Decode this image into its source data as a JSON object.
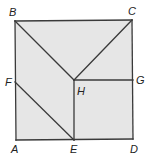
{
  "figure": {
    "type": "geometry-square-partition",
    "fill_color": "#e6e6e6",
    "stroke_color": "#3a3a3a",
    "points": {
      "A": {
        "label": "A",
        "x": 16,
        "y": 140
      },
      "B": {
        "label": "B",
        "x": 15,
        "y": 21
      },
      "C": {
        "label": "C",
        "x": 132,
        "y": 20
      },
      "D": {
        "label": "D",
        "x": 133,
        "y": 139
      },
      "E": {
        "label": "E",
        "x": 74,
        "y": 140
      },
      "F": {
        "label": "F",
        "x": 15,
        "y": 82
      },
      "G": {
        "label": "G",
        "x": 133,
        "y": 80
      },
      "H": {
        "label": "H",
        "x": 74,
        "y": 80
      }
    },
    "segments": [
      [
        "A",
        "B"
      ],
      [
        "B",
        "C"
      ],
      [
        "C",
        "D"
      ],
      [
        "D",
        "A"
      ],
      [
        "B",
        "H"
      ],
      [
        "C",
        "H"
      ],
      [
        "H",
        "G"
      ],
      [
        "H",
        "E"
      ],
      [
        "F",
        "E"
      ]
    ],
    "labels": {
      "A": "A",
      "B": "B",
      "C": "C",
      "D": "D",
      "E": "E",
      "F": "F",
      "G": "G",
      "H": "H"
    }
  }
}
